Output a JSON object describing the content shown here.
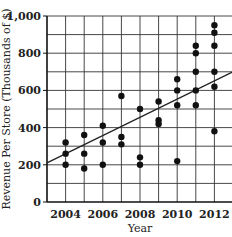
{
  "chart_data": {
    "type": "scatter",
    "title": "",
    "xlabel": "Year",
    "ylabel": "Revenue Per Store (Thousands of $)",
    "xlim": [
      2003,
      2013
    ],
    "ylim": [
      0,
      1000
    ],
    "grid": true,
    "x_grid_step": 1,
    "y_grid_step": 100,
    "x_ticks": [
      2004,
      2006,
      2008,
      2010,
      2012
    ],
    "y_ticks": [
      0,
      200,
      400,
      600,
      800,
      1000
    ],
    "y_tick_labels": [
      "0",
      "200",
      "400",
      "600",
      "800",
      "1,000"
    ],
    "points": [
      {
        "x": 2004,
        "y": 320
      },
      {
        "x": 2004,
        "y": 260
      },
      {
        "x": 2004,
        "y": 200
      },
      {
        "x": 2005,
        "y": 360
      },
      {
        "x": 2005,
        "y": 260
      },
      {
        "x": 2005,
        "y": 180
      },
      {
        "x": 2006,
        "y": 410
      },
      {
        "x": 2006,
        "y": 320
      },
      {
        "x": 2006,
        "y": 200
      },
      {
        "x": 2007,
        "y": 570
      },
      {
        "x": 2007,
        "y": 350
      },
      {
        "x": 2007,
        "y": 310
      },
      {
        "x": 2008,
        "y": 500
      },
      {
        "x": 2008,
        "y": 240
      },
      {
        "x": 2008,
        "y": 200
      },
      {
        "x": 2009,
        "y": 540
      },
      {
        "x": 2009,
        "y": 440
      },
      {
        "x": 2009,
        "y": 420
      },
      {
        "x": 2010,
        "y": 660
      },
      {
        "x": 2010,
        "y": 600
      },
      {
        "x": 2010,
        "y": 520
      },
      {
        "x": 2010,
        "y": 220
      },
      {
        "x": 2011,
        "y": 840
      },
      {
        "x": 2011,
        "y": 800
      },
      {
        "x": 2011,
        "y": 700
      },
      {
        "x": 2011,
        "y": 600
      },
      {
        "x": 2011,
        "y": 520
      },
      {
        "x": 2012,
        "y": 950
      },
      {
        "x": 2012,
        "y": 910
      },
      {
        "x": 2012,
        "y": 840
      },
      {
        "x": 2012,
        "y": 700
      },
      {
        "x": 2012,
        "y": 620
      },
      {
        "x": 2012,
        "y": 380
      }
    ],
    "trend_line": {
      "x": [
        2003,
        2013
      ],
      "y": [
        210,
        700
      ]
    },
    "colors": {
      "points": "#111111",
      "grid": "#333333",
      "line": "#222222"
    }
  }
}
